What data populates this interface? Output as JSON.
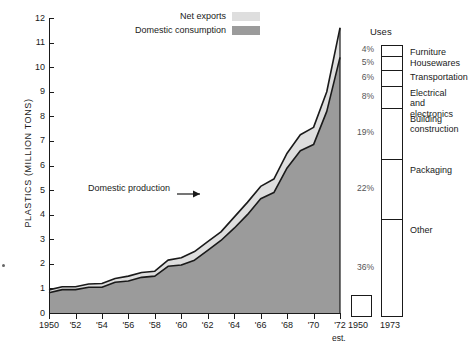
{
  "chart_data": {
    "type": "area",
    "title": "",
    "xlabel": "",
    "ylabel": "PLASTICS (MILLION TONS)",
    "ylim": [
      0,
      12
    ],
    "xlim": [
      1950,
      1972
    ],
    "grid": false,
    "legend_position": "top-center",
    "note": "Stacked area chart: Domestic consumption (dark gray) with Net exports (light gray) stacked on top; the combined top boundary is Domestic production.",
    "x": [
      1950,
      1951,
      1952,
      1953,
      1954,
      1955,
      1956,
      1957,
      1958,
      1959,
      1960,
      1961,
      1962,
      1963,
      1964,
      1965,
      1966,
      1967,
      1968,
      1969,
      1970,
      1971,
      1972
    ],
    "series": [
      {
        "name": "Domestic consumption",
        "color": "#9b9b9b",
        "values": [
          0.82,
          0.95,
          0.95,
          1.05,
          1.05,
          1.25,
          1.3,
          1.45,
          1.5,
          1.9,
          1.95,
          2.15,
          2.55,
          2.95,
          3.45,
          4.0,
          4.65,
          4.9,
          5.9,
          6.6,
          6.85,
          8.2,
          10.4
        ]
      },
      {
        "name": "Net exports",
        "color": "#dedede",
        "values": [
          0.12,
          0.12,
          0.12,
          0.13,
          0.15,
          0.15,
          0.2,
          0.2,
          0.2,
          0.25,
          0.3,
          0.35,
          0.35,
          0.35,
          0.45,
          0.5,
          0.5,
          0.55,
          0.6,
          0.65,
          0.7,
          0.8,
          1.2
        ]
      }
    ],
    "yticks": [
      0,
      1,
      2,
      3,
      4,
      5,
      6,
      7,
      8,
      9,
      10,
      11,
      12
    ],
    "ytick_labels": [
      "0",
      "1",
      "2",
      "3",
      "4",
      "5",
      "6",
      "7",
      "8",
      "9",
      "10",
      "11",
      "12"
    ],
    "xticks": [
      1950,
      1951,
      1952,
      1953,
      1954,
      1955,
      1956,
      1957,
      1958,
      1959,
      1960,
      1961,
      1962,
      1963,
      1964,
      1965,
      1966,
      1967,
      1968,
      1969,
      1970,
      1971,
      1972
    ],
    "xtick_labels": [
      "1950",
      "",
      "'52",
      "",
      "'54",
      "",
      "'56",
      "",
      "'58",
      "",
      "'60",
      "",
      "'62",
      "",
      "'64",
      "",
      "'66",
      "",
      "'68",
      "",
      "'70",
      "",
      "'72"
    ],
    "xtick_footnote": "est.",
    "annotations": [
      {
        "text": "Domestic production",
        "points_to": "upper boundary of stacked area"
      }
    ]
  },
  "legend": {
    "items": [
      {
        "label": "Net exports",
        "color": "#dedede"
      },
      {
        "label": "Domestic consumption",
        "color": "#9b9b9b"
      }
    ]
  },
  "uses_panel": {
    "title": "Uses",
    "left_bar_label": "1950",
    "right_bar_label": "1973",
    "segments": [
      {
        "pct": "4%",
        "name": "Furniture"
      },
      {
        "pct": "5%",
        "name": "Housewares"
      },
      {
        "pct": "6%",
        "name": "Transportation"
      },
      {
        "pct": "8%",
        "name": "Electrical\nand electronics"
      },
      {
        "pct": "19%",
        "name": "Building\nconstruction"
      },
      {
        "pct": "22%",
        "name": "Packaging"
      },
      {
        "pct": "36%",
        "name": "Other"
      }
    ]
  },
  "colors": {
    "net_exports": "#dedede",
    "domestic_consumption": "#9b9b9b",
    "outline": "#1a1a1a",
    "background": "#ffffff"
  }
}
